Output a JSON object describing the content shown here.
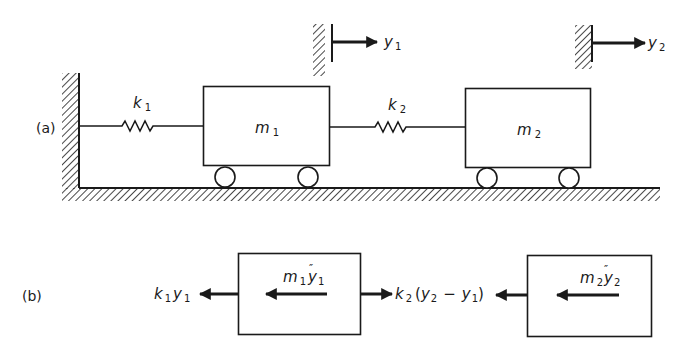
{
  "part_a": {
    "tag": "(a)",
    "spring1": {
      "label": "k",
      "sub": "1"
    },
    "spring2": {
      "label": "k",
      "sub": "2"
    },
    "mass1": {
      "label": "m",
      "sub": "1"
    },
    "mass2": {
      "label": "m",
      "sub": "2"
    },
    "disp1": {
      "label": "y",
      "sub": "1"
    },
    "disp2": {
      "label": "y",
      "sub": "2"
    }
  },
  "part_b": {
    "tag": "(b)",
    "force_left": {
      "k": "k",
      "ksub": "1",
      "y": "y",
      "ysub": "1"
    },
    "inertia1": {
      "m": "m",
      "msub": "1",
      "y": "y",
      "ysub": "1",
      "dots": "″"
    },
    "force_mid": {
      "k": "k",
      "ksub": "2",
      "open": "(",
      "y2": "y",
      "y2sub": "2",
      "minus": "−",
      "y1": "y",
      "y1sub": "1",
      "close": ")"
    },
    "inertia2": {
      "m": "m",
      "msub": "2",
      "y": "y",
      "ysub": "2",
      "dots": "″"
    }
  },
  "colors": {
    "ink": "#1a1a1a",
    "background": "#ffffff"
  }
}
